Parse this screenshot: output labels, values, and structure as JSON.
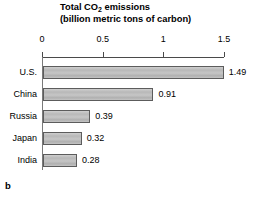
{
  "chart_data": {
    "type": "bar",
    "orientation": "horizontal",
    "title": "Total CO2 emissions (billion metric tons of carbon)",
    "title_lines": [
      {
        "pre": "Total CO",
        "sub": "2",
        "post": " emissions"
      },
      {
        "pre": "(billion metric tons of carbon)",
        "sub": "",
        "post": ""
      }
    ],
    "categories": [
      "U.S.",
      "China",
      "Russia",
      "Japan",
      "India"
    ],
    "values": [
      1.49,
      0.91,
      0.39,
      0.32,
      0.28
    ],
    "value_labels": [
      "1.49",
      "0.91",
      "0.39",
      "0.32",
      "0.28"
    ],
    "xlabel": "",
    "ylabel": "",
    "xlim": [
      0,
      1.5
    ],
    "xticks": [
      0,
      0.5,
      1,
      1.5
    ],
    "xtick_labels": [
      "0",
      "0.5",
      "1",
      "1.5"
    ],
    "grid": false,
    "legend": null,
    "axis_position": "top",
    "panel_letter": "b",
    "colors": {
      "bar_fill": "#c0c0c0",
      "bar_border": "#5c5c5c",
      "axis": "#4a4a4a",
      "text": "#000000",
      "background": "#ffffff"
    }
  }
}
